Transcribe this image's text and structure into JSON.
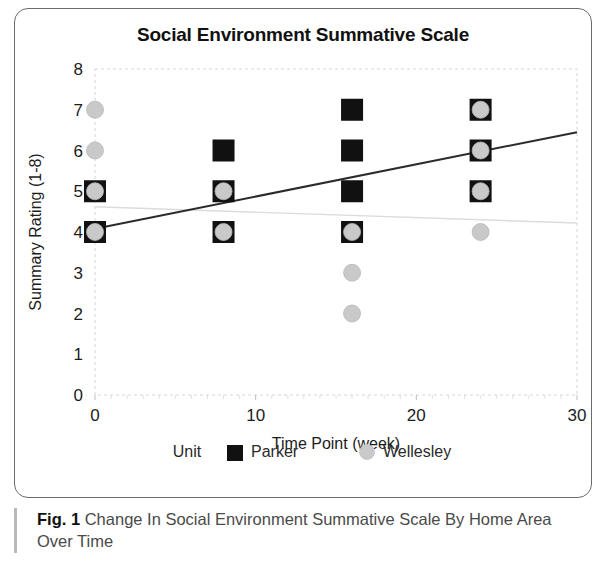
{
  "figure": {
    "caption_label": "Fig. 1",
    "caption_text": "Change In Social Environment Summative Scale By Home Area Over Time"
  },
  "chart_data": {
    "type": "scatter",
    "title": "Social Environment Summative Scale",
    "xlabel": "Time Point (week)",
    "ylabel": "Summary Rating (1-8)",
    "xlim": [
      0,
      30
    ],
    "ylim": [
      0,
      8
    ],
    "xticks": [
      0,
      10,
      20,
      30
    ],
    "xtick_labels": [
      "0",
      "10",
      "20",
      "30"
    ],
    "yticks": [
      0,
      1,
      2,
      3,
      4,
      5,
      6,
      7,
      8
    ],
    "ytick_labels": [
      "0",
      "1",
      "2",
      "3",
      "4",
      "5",
      "6",
      "7",
      "8"
    ],
    "grid": false,
    "legend_title": "Unit",
    "legend_position": "bottom",
    "series": [
      {
        "name": "Parker",
        "marker": "square",
        "color": "#111111",
        "points": [
          {
            "x": 0,
            "y": 5
          },
          {
            "x": 0,
            "y": 4
          },
          {
            "x": 8,
            "y": 6
          },
          {
            "x": 8,
            "y": 5
          },
          {
            "x": 8,
            "y": 4
          },
          {
            "x": 16,
            "y": 7
          },
          {
            "x": 16,
            "y": 6
          },
          {
            "x": 16,
            "y": 5
          },
          {
            "x": 16,
            "y": 4
          },
          {
            "x": 24,
            "y": 7
          },
          {
            "x": 24,
            "y": 6
          },
          {
            "x": 24,
            "y": 5
          }
        ],
        "trendline": {
          "x0": 0,
          "y0": 4.08,
          "x1": 30,
          "y1": 6.45,
          "color": "#2b2b2b"
        }
      },
      {
        "name": "Wellesley",
        "marker": "circle",
        "color": "#c9c9c9",
        "points": [
          {
            "x": 0,
            "y": 7
          },
          {
            "x": 0,
            "y": 6
          },
          {
            "x": 0,
            "y": 5
          },
          {
            "x": 0,
            "y": 4
          },
          {
            "x": 8,
            "y": 5
          },
          {
            "x": 8,
            "y": 4
          },
          {
            "x": 16,
            "y": 4
          },
          {
            "x": 16,
            "y": 3
          },
          {
            "x": 16,
            "y": 2
          },
          {
            "x": 24,
            "y": 7
          },
          {
            "x": 24,
            "y": 6
          },
          {
            "x": 24,
            "y": 5
          },
          {
            "x": 24,
            "y": 4
          }
        ],
        "trendline": {
          "x0": 0,
          "y0": 4.62,
          "x1": 30,
          "y1": 4.22,
          "color": "#dcdcdc"
        }
      }
    ]
  }
}
